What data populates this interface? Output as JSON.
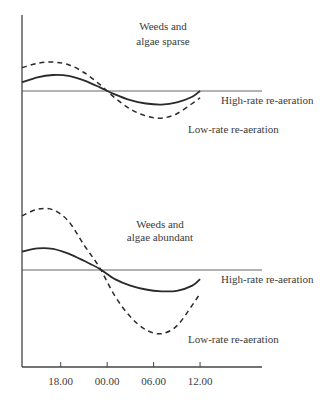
{
  "chart_data": {
    "type": "line",
    "title": "",
    "xlabel": "",
    "ylabel": "",
    "x_ticks": [
      "18.00",
      "00.00",
      "06.00",
      "12.00"
    ],
    "x_tick_values": [
      18,
      24,
      30,
      36
    ],
    "xlim": [
      13,
      44
    ],
    "grid": false,
    "panels": [
      {
        "title_lines": [
          "Weeds and",
          "algae sparse"
        ],
        "ylim": [
          -1.5,
          2.0
        ],
        "baseline": 0,
        "x": [
          13,
          15,
          17,
          19,
          21,
          23,
          25,
          27,
          29,
          31,
          33,
          35,
          36
        ],
        "series": [
          {
            "name": "High-rate re-aeration",
            "style": "solid",
            "values": [
              0.45,
              0.7,
              0.82,
              0.78,
              0.55,
              0.2,
              -0.15,
              -0.4,
              -0.55,
              -0.6,
              -0.5,
              -0.25,
              0.0
            ]
          },
          {
            "name": "Low-rate re-aeration",
            "style": "dashed",
            "values": [
              1.2,
              1.42,
              1.48,
              1.35,
              0.95,
              0.35,
              -0.3,
              -0.8,
              -1.1,
              -1.2,
              -1.0,
              -0.55,
              -0.3
            ]
          }
        ]
      },
      {
        "title_lines": [
          "Weeds and",
          "algae abundant"
        ],
        "ylim": [
          -2.5,
          2.5
        ],
        "baseline": 0,
        "x": [
          13,
          15,
          17,
          19,
          21,
          23,
          25,
          27,
          29,
          31,
          33,
          35,
          36
        ],
        "series": [
          {
            "name": "High-rate re-aeration",
            "style": "solid",
            "values": [
              0.7,
              0.82,
              0.8,
              0.62,
              0.35,
              0.05,
              -0.35,
              -0.6,
              -0.75,
              -0.82,
              -0.8,
              -0.6,
              -0.35
            ]
          },
          {
            "name": "Low-rate re-aeration",
            "style": "dashed",
            "values": [
              2.05,
              2.3,
              2.28,
              1.85,
              0.95,
              0.1,
              -1.0,
              -1.8,
              -2.3,
              -2.45,
              -2.15,
              -1.35,
              -0.9
            ]
          }
        ]
      }
    ]
  }
}
